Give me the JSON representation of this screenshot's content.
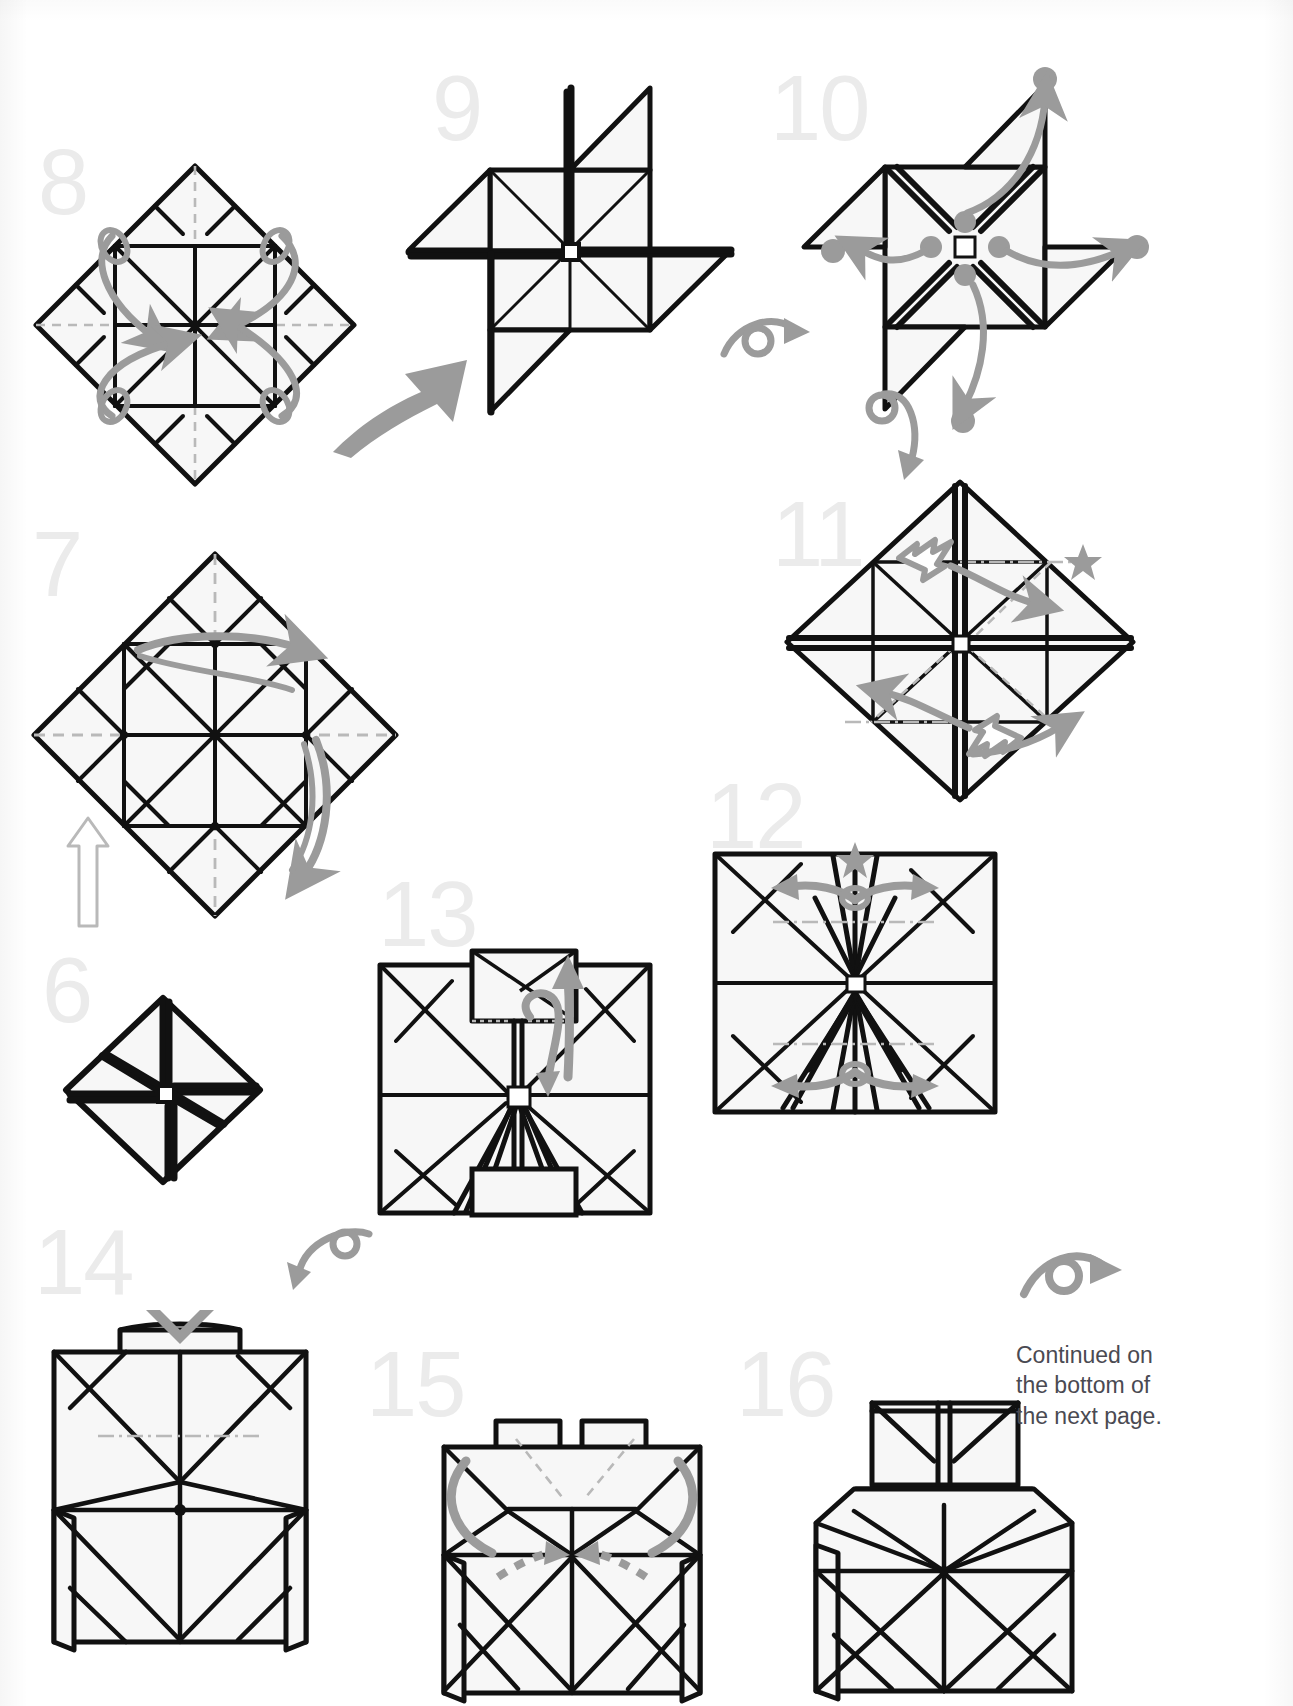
{
  "page": {
    "kind": "origami-instruction-diagram",
    "width": 1293,
    "height": 1706,
    "background_color": "#ffffff",
    "ink_color": "#111111",
    "paper_fill": "#f7f7f7",
    "arrow_color": "#9b9b9b",
    "number_color": "#ebebeb",
    "caption_color": "#4a4a52"
  },
  "caption": {
    "line1": "Continued on",
    "line2": "the bottom of",
    "line3": "the next page."
  },
  "steps": [
    {
      "number": "6",
      "label": "step-6",
      "shape": "small diamond with pinwheel cross",
      "notes": "Completed blintz pinwheel base, small, rotated 45 degrees",
      "markers": []
    },
    {
      "number": "7",
      "label": "step-7",
      "shape": "large diamond with 4x4 grid crease pattern",
      "notes": "Dashed valley creases on both diagonals; two gray curved fold arrows; hollow outline arrow below pointing up",
      "markers": [
        "hollow-up-arrow",
        "gray-curved-arrow-right",
        "gray-curved-arrow-down"
      ]
    },
    {
      "number": "8",
      "label": "step-8",
      "shape": "diamond with grid and dash-dot creases",
      "notes": "Four gray looping arrows pointing toward the center; dash-dot (mountain) creases form an inner square",
      "markers": [
        "loop-arrow-nw",
        "loop-arrow-ne",
        "loop-arrow-sw",
        "loop-arrow-se"
      ]
    },
    {
      "number": "9",
      "label": "step-9",
      "shape": "pinwheel with four triangular flaps",
      "notes": "Result of step 8; four flaps spin outward",
      "markers": []
    },
    {
      "number": "10",
      "label": "step-10",
      "shape": "pinwheel square with X and four flaps",
      "notes": "Four gray dots at center of X, four gray dots outside at flap tips, four gray curved arrows matching dots",
      "markers": [
        "dot-center-n",
        "dot-center-w",
        "dot-center-e",
        "dot-center-s",
        "dot-outer-n",
        "dot-outer-w",
        "dot-outer-e",
        "dot-outer-s",
        "turn-over-symbol"
      ]
    },
    {
      "number": "11",
      "label": "step-11",
      "shape": "diamond with raised ridge creases",
      "notes": "Star marker at right; two hollow push arrows and two gray curved arrows",
      "markers": [
        "star",
        "push-arrow-upper",
        "push-arrow-lower",
        "gray-arrow-right",
        "gray-arrow-left"
      ]
    },
    {
      "number": "12",
      "label": "step-12",
      "shape": "square with central pleat gathered vertically",
      "notes": "Star marker at top edge; pairs of gray spread arrows at top and bottom",
      "markers": [
        "star",
        "spread-arrows-top",
        "spread-arrows-bottom"
      ]
    },
    {
      "number": "13",
      "label": "step-13",
      "shape": "square with small flap raised at top",
      "notes": "Gray curved arrow and straight up arrow above the small top flap",
      "markers": [
        "gray-curl-arrow",
        "gray-up-arrow"
      ]
    },
    {
      "number": "14",
      "label": "step-14",
      "shape": "box front view with narrow lip at top",
      "notes": "Gray V (valley) arrow pointing down onto the top lip; dash-dot horizontal crease across the middle",
      "markers": [
        "v-arrow-down",
        "turn-over-symbol"
      ]
    },
    {
      "number": "15",
      "label": "step-15",
      "shape": "box with split T-shaped top flaps",
      "notes": "Two gray dotted arrows pointing inward (hidden layers) plus two gray curved wrap-around arrows",
      "markers": [
        "dotted-arrow-left",
        "dotted-arrow-right",
        "wrap-arrow-left",
        "wrap-arrow-right"
      ]
    },
    {
      "number": "16",
      "label": "step-16",
      "shape": "box with tall narrow neck on top",
      "notes": "Final figure on this page, leads to the next page",
      "markers": [
        "turn-over-symbol"
      ]
    }
  ],
  "symbols": {
    "turn_over": "turn-over-arrow",
    "star": "★",
    "dot": "●",
    "hollow_arrow": "outline-arrow"
  }
}
